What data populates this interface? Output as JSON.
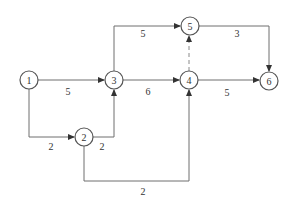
{
  "diagram": {
    "type": "activity-on-arrow network",
    "nodes": [
      {
        "id": "1",
        "label": "1",
        "x": 29,
        "y": 80
      },
      {
        "id": "2",
        "label": "2",
        "x": 84,
        "y": 137
      },
      {
        "id": "3",
        "label": "3",
        "x": 114,
        "y": 80
      },
      {
        "id": "4",
        "label": "4",
        "x": 189,
        "y": 80
      },
      {
        "id": "5",
        "label": "5",
        "x": 190,
        "y": 26
      },
      {
        "id": "6",
        "label": "6",
        "x": 269,
        "y": 81
      }
    ],
    "edges": [
      {
        "from": "1",
        "to": "3",
        "duration": "5",
        "dashed": false
      },
      {
        "from": "1",
        "to": "2",
        "duration": "2",
        "dashed": false
      },
      {
        "from": "2",
        "to": "3",
        "duration": "2",
        "dashed": false
      },
      {
        "from": "2",
        "to": "4",
        "duration": "2",
        "dashed": false
      },
      {
        "from": "3",
        "to": "5",
        "duration": "5",
        "dashed": false
      },
      {
        "from": "3",
        "to": "4",
        "duration": "6",
        "dashed": false
      },
      {
        "from": "4",
        "to": "5",
        "duration": "",
        "dashed": true
      },
      {
        "from": "5",
        "to": "6",
        "duration": "3",
        "dashed": false
      },
      {
        "from": "4",
        "to": "6",
        "duration": "5",
        "dashed": false
      }
    ]
  },
  "labels": {
    "n1": "1",
    "n2": "2",
    "n3": "3",
    "n4": "4",
    "n5": "5",
    "n6": "6",
    "e13": "5",
    "e12": "2",
    "e23": "2",
    "e24": "2",
    "e35": "5",
    "e34": "6",
    "e56": "3",
    "e46": "5"
  },
  "colors": {
    "line": "#6e6e6e",
    "node_stroke": "#555555",
    "text": "#333333",
    "background": "#ffffff"
  }
}
